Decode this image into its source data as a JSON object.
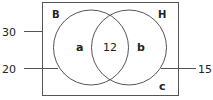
{
  "diagram": {
    "type": "venn",
    "universal_set": {
      "label": "",
      "region_label": "c"
    },
    "sets": [
      {
        "name": "B",
        "region_label": "a"
      },
      {
        "name": "H",
        "region_label": "b"
      }
    ],
    "intersection_value": "12",
    "pointers": [
      {
        "value": "30",
        "points_to": "universal set"
      },
      {
        "value": "20",
        "points_to": "set B"
      },
      {
        "value": "15",
        "points_to": "set H"
      }
    ],
    "colors": {
      "stroke": "#555555",
      "text": "#222222"
    }
  }
}
